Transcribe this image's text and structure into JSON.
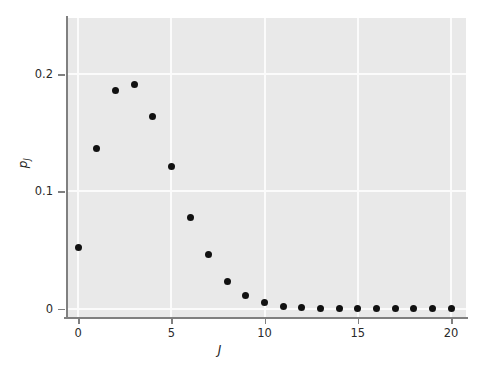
{
  "figure": {
    "width": 491,
    "height": 375,
    "background": "#ffffff",
    "panel_background": "#e9e9e9",
    "grid_color": "#fbfbfb",
    "axis_color": "#808080",
    "point_color": "#111111"
  },
  "axes": {
    "xlabel": "J",
    "ylabel_main": "p",
    "ylabel_sub": "J",
    "x_ticklabels": [
      "0",
      "5",
      "10",
      "15",
      "20"
    ],
    "y_ticklabels": [
      "0",
      "0.1",
      "0.2"
    ]
  },
  "chart_data": {
    "type": "scatter",
    "title": "",
    "xlabel": "J",
    "ylabel": "p_J",
    "xlim": [
      -0.6,
      20.8
    ],
    "ylim": [
      -0.008,
      0.248
    ],
    "xticks": [
      0,
      5,
      10,
      15,
      20
    ],
    "yticks": [
      0,
      0.1,
      0.2
    ],
    "grid": true,
    "legend": "none",
    "marker": "filled-circle",
    "x": [
      0,
      1,
      2,
      3,
      4,
      5,
      6,
      7,
      8,
      9,
      10,
      11,
      12,
      13,
      14,
      15,
      16,
      17,
      18,
      19,
      20
    ],
    "values": [
      0.052,
      0.137,
      0.186,
      0.191,
      0.164,
      0.121,
      0.078,
      0.046,
      0.023,
      0.011,
      0.005,
      0.002,
      0.001,
      0.0005,
      0.0002,
      0.0001,
      0.0001,
      0.0,
      0.0,
      0.0,
      0.0
    ]
  }
}
